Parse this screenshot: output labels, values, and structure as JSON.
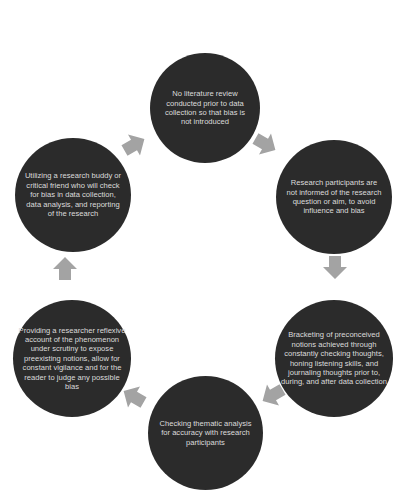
{
  "diagram": {
    "type": "cycle",
    "circle_color": "#2b2b2b",
    "text_color": "#dcdcdc",
    "arrow_color": "#a3a3a3",
    "nodes": [
      {
        "id": "top",
        "text": "No literature review conducted prior to data collection so that bias is not introduced"
      },
      {
        "id": "right-top",
        "text": "Research participants are not informed of the research question or aim, to avoid influence and bias"
      },
      {
        "id": "right-bottom",
        "text": "Bracketing of preconceived notions achieved through constantly checking thoughts, honing listening skills, and journaling thoughts prior to, during, and after data collection"
      },
      {
        "id": "bottom",
        "text": "Checking thematic analysis for accuracy with research participants"
      },
      {
        "id": "left-bottom",
        "text": "Providing a researcher reflexive account of the phenomenon under scrutiny to expose preexisting notions, allow for constant vigilance and for the reader to judge any possible bias"
      },
      {
        "id": "left-top",
        "text": "Utilizing a research buddy or critical friend who will check for bias in data collection, data analysis, and reporting of the research"
      }
    ],
    "arrows": [
      {
        "from": "top",
        "to": "right-top",
        "direction": "down-right"
      },
      {
        "from": "right-top",
        "to": "right-bottom",
        "direction": "down"
      },
      {
        "from": "right-bottom",
        "to": "bottom",
        "direction": "down-left"
      },
      {
        "from": "bottom",
        "to": "left-bottom",
        "direction": "up-left"
      },
      {
        "from": "left-bottom",
        "to": "left-top",
        "direction": "up"
      },
      {
        "from": "left-top",
        "to": "top",
        "direction": "up-right"
      }
    ]
  }
}
